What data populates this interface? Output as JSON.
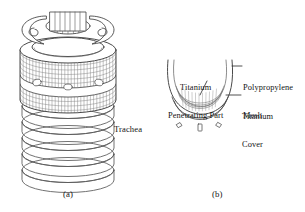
{
  "figure": {
    "background_color": "#ffffff",
    "line_color": "#4a4a4a",
    "mesh_color": "#6b6b6b",
    "text_color": "#141414",
    "panels": [
      {
        "id": "a",
        "caption": "(a)",
        "title": "Tracheal stent implant with polypropylene mesh cover",
        "labels": [
          {
            "name": "trachea",
            "text": "Trachea"
          }
        ]
      },
      {
        "id": "b",
        "caption": "(b)",
        "title": "Cross-section of the device layers",
        "labels": [
          {
            "name": "titanium-penetrating-part",
            "text": "Titanium\nPenetrating Part"
          },
          {
            "name": "polypropylene-mesh",
            "text": "Polypropylene\nMesh"
          },
          {
            "name": "titanium-cover",
            "text": "Titanium\nCover"
          }
        ]
      }
    ]
  },
  "labels": {
    "trachea": "Trachea",
    "titanium_penetrating_line1": "Titanium",
    "titanium_penetrating_line2": "Penetrating Part",
    "polypropylene_line1": "Polypropylene",
    "polypropylene_line2": "Mesh",
    "titanium_cover_line1": "Titanium",
    "titanium_cover_line2": "Cover",
    "caption_a": "(a)",
    "caption_b": "(b)"
  },
  "panel_a_geometry": {
    "ring_count": 5,
    "mesh_columns": 30,
    "mesh_rows": 11,
    "band_ellipse_count": 3,
    "top_stripe_count": 7
  },
  "panel_b_geometry": {
    "mesh_arc_count": 5,
    "cover_arc_count": 2,
    "penetrating_pin_count": 3
  }
}
